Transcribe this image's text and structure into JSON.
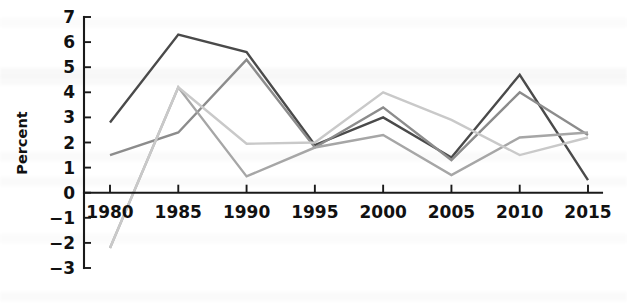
{
  "chart_data": {
    "type": "line",
    "title": "",
    "subtitle": "",
    "xlabel": "",
    "ylabel": "Percent",
    "categories": [
      "1980",
      "1985",
      "1990",
      "1995",
      "2000",
      "2005",
      "2010",
      "2015"
    ],
    "x": [
      1980,
      1985,
      1990,
      1995,
      2000,
      2005,
      2010,
      2015
    ],
    "xlim": [
      1980,
      2015
    ],
    "ylim": [
      -3,
      7
    ],
    "ytick_labels": [
      "7",
      "6",
      "5",
      "4",
      "3",
      "2",
      "1",
      "0",
      "−1",
      "−2",
      "−3"
    ],
    "ytick_values": [
      7,
      6,
      5,
      4,
      3,
      2,
      1,
      0,
      -1,
      -2,
      -3
    ],
    "grid": false,
    "legend": false,
    "legend_position": "none",
    "series": [
      {
        "name": "series-1",
        "color": "#4a4a4a",
        "values": [
          2.8,
          6.3,
          5.6,
          1.9,
          3.0,
          1.4,
          4.7,
          0.5
        ]
      },
      {
        "name": "series-2",
        "color": "#8c8c8c",
        "values": [
          1.5,
          2.4,
          5.3,
          1.8,
          3.4,
          1.3,
          4.0,
          2.3
        ]
      },
      {
        "name": "series-3",
        "color": "#a6a6a6",
        "values": [
          -2.2,
          4.2,
          0.65,
          1.8,
          2.3,
          0.7,
          2.2,
          2.4
        ]
      },
      {
        "name": "series-4",
        "color": "#c9c9c9",
        "values": [
          -2.2,
          4.2,
          1.95,
          2.0,
          4.0,
          2.9,
          1.5,
          2.2
        ]
      }
    ]
  },
  "axes": {
    "y_axis_name": "y-axis",
    "x_axis_name": "x-axis"
  }
}
